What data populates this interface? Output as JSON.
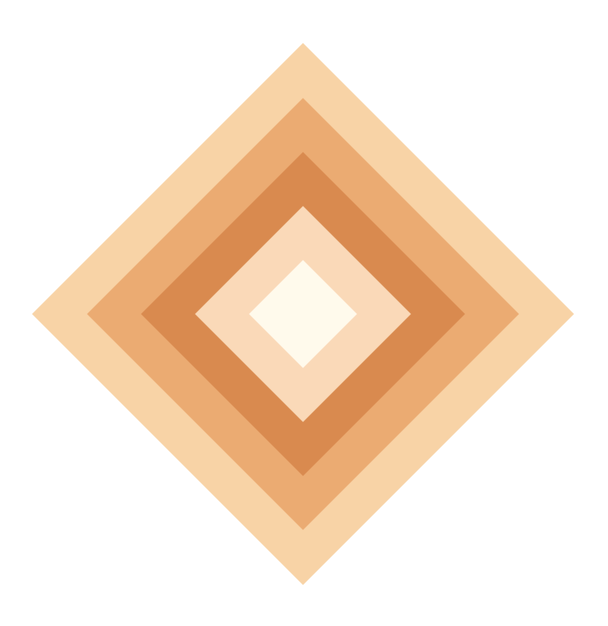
{
  "artwork": {
    "description": "Concentric nested diamonds in graduated warm tones",
    "background": "#ffffff",
    "layers": [
      {
        "name": "outer-diamond",
        "color": "#F8D3A6"
      },
      {
        "name": "second-diamond",
        "color": "#EBAB72"
      },
      {
        "name": "third-diamond",
        "color": "#D98A4F"
      },
      {
        "name": "fourth-diamond",
        "color": "#FAD9B8"
      },
      {
        "name": "inner-diamond",
        "color": "#FFFAEC"
      }
    ]
  }
}
